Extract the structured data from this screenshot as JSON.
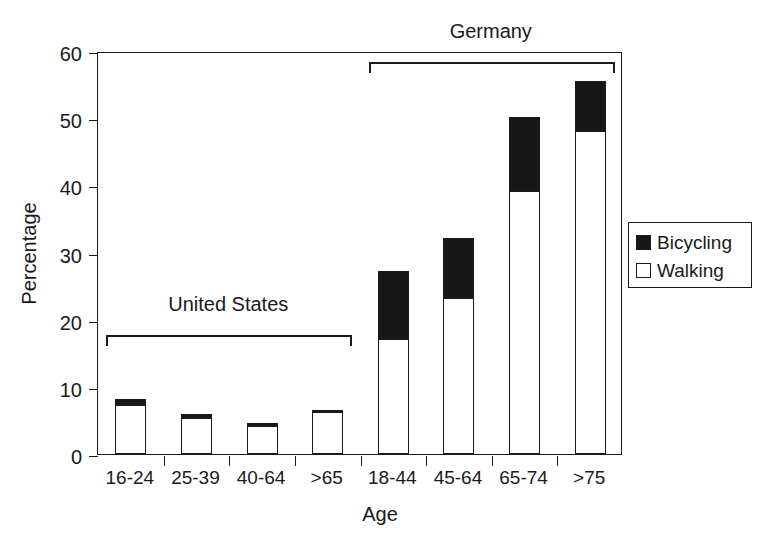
{
  "chart_data": {
    "type": "bar",
    "subtype": "stacked-bar",
    "title": "",
    "xlabel": "Age",
    "ylabel": "Percentage",
    "ylim": [
      0,
      60
    ],
    "yticks": [
      0,
      10,
      20,
      30,
      40,
      50,
      60
    ],
    "ytick_labels": [
      "0",
      "10",
      "20",
      "30",
      "40",
      "50",
      "60"
    ],
    "grid": false,
    "categories": [
      "16-24",
      "25-39",
      "40-64",
      ">65",
      "18-44",
      "45-64",
      "65-74",
      ">75"
    ],
    "series": [
      {
        "name": "Walking",
        "color": "#ffffff",
        "values": [
          7.3,
          5.3,
          4.2,
          6.2,
          17.1,
          23.3,
          39.2,
          48.1
        ]
      },
      {
        "name": "Bicycling",
        "color": "#171717",
        "values": [
          0.9,
          0.6,
          0.4,
          0.4,
          10.1,
          8.9,
          11.0,
          7.4
        ]
      }
    ],
    "totals": [
      8.2,
      5.9,
      4.6,
      6.6,
      27.2,
      32.2,
      50.2,
      55.5
    ],
    "groups": [
      {
        "label": "United States",
        "categories": [
          "16-24",
          "25-39",
          "40-64",
          ">65"
        ]
      },
      {
        "label": "Germany",
        "categories": [
          "18-44",
          "45-64",
          "65-74",
          ">75"
        ]
      }
    ],
    "legend": {
      "position": "right",
      "entries": [
        {
          "label": "Bicycling",
          "marker": "filled-square",
          "color": "#171717"
        },
        {
          "label": "Walking",
          "marker": "hollow-square",
          "color": "#ffffff"
        }
      ]
    }
  }
}
